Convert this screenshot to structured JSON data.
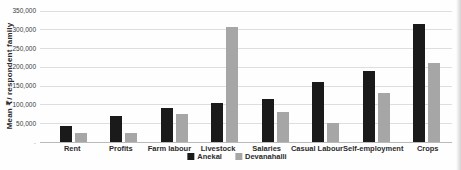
{
  "chart_data": {
    "type": "bar",
    "title": "",
    "xlabel": "",
    "ylabel": "Mean ₹/ respondent family",
    "categories": [
      "Rent",
      "Profits",
      "Farm labour",
      "Livestock",
      "Salaries",
      "Casual Labour",
      "Self-employment",
      "Crops"
    ],
    "series": [
      {
        "name": "Anekal",
        "color": "#1a1a1a",
        "values": [
          43000,
          70000,
          90000,
          105000,
          115000,
          160000,
          190000,
          315000
        ]
      },
      {
        "name": "Devanahalli",
        "color": "#a6a6a6",
        "values": [
          25000,
          25000,
          75000,
          305000,
          80000,
          50000,
          130000,
          210000
        ]
      }
    ],
    "ylim": [
      0,
      350000
    ],
    "ytick_step": 50000,
    "ytick_labels": [
      "350,000",
      "300,000",
      "250,000",
      "200,000",
      "150,000",
      "100,000",
      "50,000"
    ],
    "zero_tick_label": "-",
    "grid": "horizontal",
    "gridline_color": "#dedede",
    "baseline_color": "#b9b9b9",
    "legend_position": "bottom-center"
  }
}
